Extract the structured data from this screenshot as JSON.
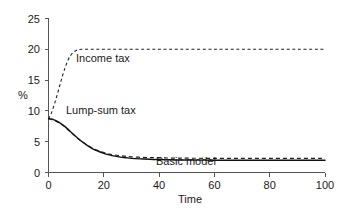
{
  "chart_data": {
    "type": "line",
    "title": "",
    "xlabel": "Time",
    "ylabel": "%",
    "xlim": [
      0,
      100
    ],
    "ylim": [
      0,
      25
    ],
    "xticks": [
      0,
      20,
      40,
      60,
      80,
      100
    ],
    "yticks": [
      0,
      5,
      10,
      15,
      20,
      25
    ],
    "xtick_labels": [
      "0",
      "20",
      "40",
      "60",
      "80",
      "100"
    ],
    "ytick_labels": [
      "0",
      "5",
      "10",
      "15",
      "20",
      "25"
    ],
    "grid": false,
    "legend_position": "inline-annotations",
    "x": [
      0,
      1,
      2,
      3,
      4,
      5,
      6,
      7,
      8,
      9,
      10,
      11,
      12,
      14,
      16,
      18,
      20,
      22,
      24,
      26,
      28,
      30,
      34,
      38,
      42,
      46,
      50,
      60,
      70,
      80,
      90,
      100
    ],
    "series": [
      {
        "name": "Income tax",
        "style": "dashed",
        "annotation": "Income tax",
        "values": [
          8.7,
          9.6,
          10.9,
          12.4,
          14.0,
          15.6,
          17.0,
          18.2,
          19.0,
          19.5,
          19.8,
          19.95,
          20.0,
          20.0,
          20.0,
          20.0,
          20.0,
          20.0,
          20.0,
          20.0,
          20.0,
          20.0,
          20.0,
          20.0,
          20.0,
          20.0,
          20.0,
          20.0,
          20.0,
          20.0,
          20.0,
          20.0
        ]
      },
      {
        "name": "Lump-sum tax",
        "style": "dashed",
        "annotation": "Lump-sum tax",
        "values": [
          8.7,
          8.6,
          8.45,
          8.25,
          8.0,
          7.7,
          7.35,
          6.95,
          6.55,
          6.15,
          5.75,
          5.4,
          5.05,
          4.45,
          3.95,
          3.55,
          3.25,
          3.0,
          2.85,
          2.72,
          2.62,
          2.55,
          2.45,
          2.4,
          2.36,
          2.34,
          2.32,
          2.3,
          2.3,
          2.3,
          2.3,
          2.3
        ]
      },
      {
        "name": "Basic model",
        "style": "solid",
        "annotation": "Basic model",
        "values": [
          8.75,
          8.7,
          8.55,
          8.35,
          8.1,
          7.8,
          7.45,
          7.05,
          6.6,
          6.2,
          5.8,
          5.4,
          5.05,
          4.4,
          3.85,
          3.45,
          3.1,
          2.85,
          2.65,
          2.5,
          2.4,
          2.3,
          2.2,
          2.12,
          2.08,
          2.04,
          2.02,
          2.0,
          2.0,
          2.0,
          2.0,
          2.0
        ]
      }
    ],
    "annotations": [
      {
        "text": "Income tax",
        "x": 12,
        "y": 18.2
      },
      {
        "text": "Lump-sum tax",
        "x": 9,
        "y": 8.7
      },
      {
        "text": "Basic model",
        "x": 41,
        "y": 1.5
      }
    ]
  }
}
